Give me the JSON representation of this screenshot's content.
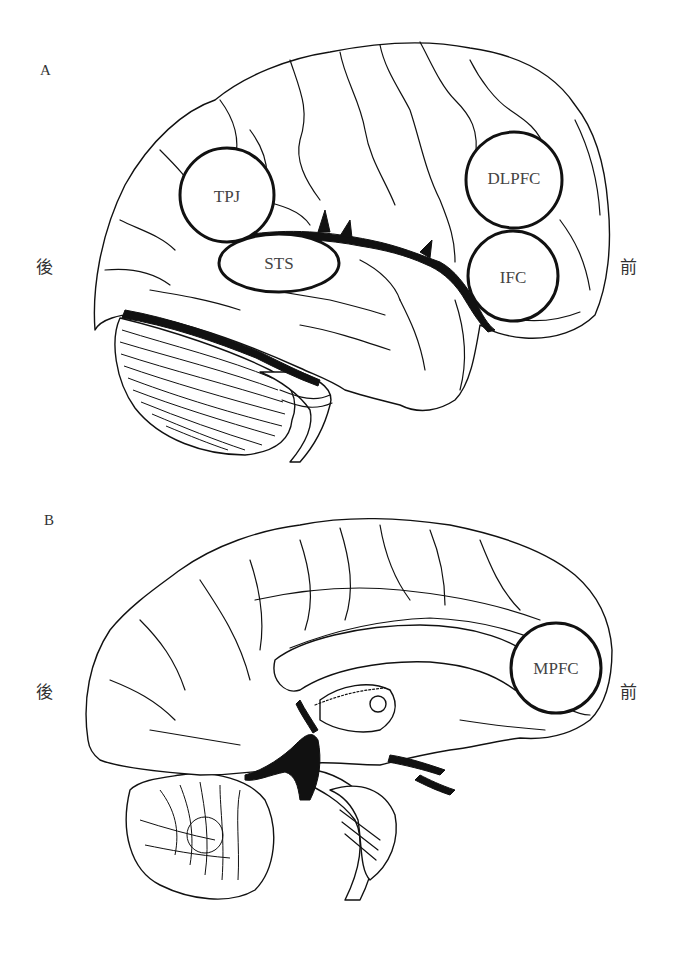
{
  "figure": {
    "panel_a": {
      "label": "A",
      "view": "lateral",
      "posterior_label": "後",
      "anterior_label": "前",
      "regions": [
        {
          "id": "tpj",
          "label": "TPJ"
        },
        {
          "id": "sts",
          "label": "STS"
        },
        {
          "id": "dlpfc",
          "label": "DLPFC"
        },
        {
          "id": "ifc",
          "label": "IFC"
        }
      ]
    },
    "panel_b": {
      "label": "B",
      "view": "medial",
      "posterior_label": "後",
      "anterior_label": "前",
      "regions": [
        {
          "id": "mpfc",
          "label": "MPFC"
        }
      ]
    },
    "caption": ""
  }
}
